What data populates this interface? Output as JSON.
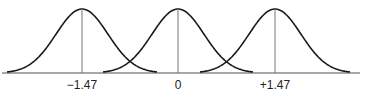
{
  "chart_data": {
    "type": "line",
    "title": "",
    "xlabel": "",
    "ylabel": "",
    "series": [
      {
        "name": "left",
        "mean": -1.47
      },
      {
        "name": "center",
        "mean": 0
      },
      {
        "name": "right",
        "mean": 1.47
      }
    ],
    "tick_labels": [
      "−1.47",
      "0",
      "+1.47"
    ],
    "grid": false
  },
  "labels": {
    "left": "−1.47",
    "center": "0",
    "right": "+1.47"
  },
  "colors": {
    "curve": "#1a1a1a",
    "axis": "#888888",
    "mean_line": "#777777"
  }
}
